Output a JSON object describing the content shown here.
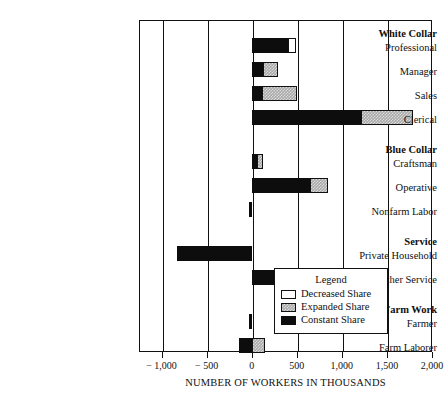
{
  "chart_data": {
    "type": "bar",
    "orientation": "horizontal",
    "stacked": true,
    "title": "",
    "xlabel": "NUMBER OF WORKERS IN THOUSANDS",
    "ylabel": "",
    "xlim": [
      -1250,
      2000
    ],
    "xticks": [
      -1000,
      -500,
      0,
      500,
      1000,
      1500,
      2000
    ],
    "xtick_labels": [
      "− 1,000",
      "− 500",
      "0",
      "500",
      "1,000",
      "1,500",
      "2,000"
    ],
    "grid": true,
    "grid_axis": "x",
    "legend_position": "inside-bottom-right",
    "series": [
      {
        "name": "Constant Share",
        "color": "#0d0d0d",
        "fill": "solid-black"
      },
      {
        "name": "Expanded Share",
        "color": "#a8a8a8",
        "fill": "gray-hatch"
      },
      {
        "name": "Decreased Share",
        "color": "#ffffff",
        "fill": "white"
      }
    ],
    "groups": [
      {
        "label": "White Collar",
        "categories": [
          {
            "label": "Professional",
            "constant": 400,
            "expanded": 0,
            "decreased": 90
          },
          {
            "label": "Manager",
            "constant": 130,
            "expanded": 160,
            "decreased": 0
          },
          {
            "label": "Sales",
            "constant": 110,
            "expanded": 390,
            "decreased": 0
          },
          {
            "label": "Clerical",
            "constant": 1210,
            "expanded": 580,
            "decreased": 0
          }
        ]
      },
      {
        "label": "Blue Collar",
        "categories": [
          {
            "label": "Craftsman",
            "constant": 60,
            "expanded": 65,
            "decreased": 0
          },
          {
            "label": "Operative",
            "constant": 650,
            "expanded": 200,
            "decreased": 0
          },
          {
            "label": "Nonfarm Labor",
            "constant": -25,
            "expanded": 0,
            "decreased": 0,
            "negative": true
          }
        ]
      },
      {
        "label": "Service",
        "categories": [
          {
            "label": "Private Household",
            "constant": -830,
            "expanded": 0,
            "decreased": 0,
            "negative": true
          },
          {
            "label": "Other Service",
            "constant": 440,
            "expanded": 210,
            "decreased": 0
          }
        ]
      },
      {
        "label": "Farm Work",
        "categories": [
          {
            "label": "Farmer",
            "constant": -35,
            "expanded": 0,
            "decreased": 0,
            "negative": true
          },
          {
            "label": "Farm Laborer",
            "constant": -145,
            "expanded": 145,
            "decreased": 0
          }
        ]
      }
    ]
  },
  "legend": {
    "title": "Legend",
    "items": [
      {
        "label": "Decreased Share",
        "swatch": "decreased"
      },
      {
        "label": "Expanded Share",
        "swatch": "expanded"
      },
      {
        "label": "Constant Share",
        "swatch": "constant"
      }
    ]
  },
  "axis": {
    "x_title": "NUMBER OF WORKERS IN THOUSANDS",
    "tick_labels": [
      "− 1,000",
      "− 500",
      "0",
      "500",
      "1,000",
      "1,500",
      "2,000"
    ]
  }
}
